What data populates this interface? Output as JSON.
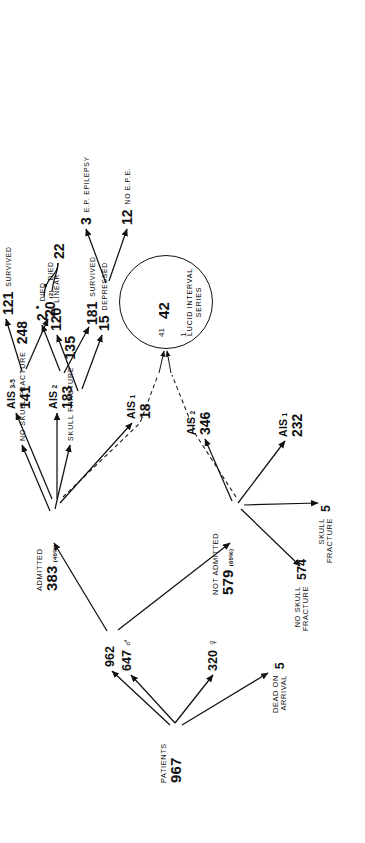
{
  "figure": {
    "type": "tree-diagram",
    "orientation": "rotated-90-ccw"
  },
  "nodes": {
    "patients": {
      "label": "PATIENTS",
      "value": "967"
    },
    "male": {
      "value": "647",
      "symbol": "♂"
    },
    "female": {
      "value": "320",
      "symbol": "♀"
    },
    "dead_on_arrival": {
      "label_line1": "DEAD ON",
      "label_line2": "ARRIVAL",
      "value": "5"
    },
    "surviving": {
      "value": "962"
    },
    "admitted": {
      "label": "ADMITTED",
      "value": "383",
      "pct": "(40%)"
    },
    "not_admitted": {
      "label": "NOT ADMITTED",
      "value": "579",
      "pct": "(60%)"
    },
    "na_no_skull_fracture": {
      "label_line1": "NO SKULL",
      "label_line2": "FRACTURE",
      "value": "574"
    },
    "na_skull_fracture": {
      "label_line1": "SKULL",
      "label_line2": "FRACTURE",
      "value": "5"
    },
    "na_ais1": {
      "label": "AIS",
      "sub": "1",
      "value": "232"
    },
    "na_ais2": {
      "label": "AIS",
      "sub": "2",
      "value": "346"
    },
    "ad_no_skull_fracture": {
      "label": "NO  SKULL  FRACTURE",
      "value": "248"
    },
    "ad_skull_fracture": {
      "label": "SKULL  FRACTURE",
      "value": "135"
    },
    "linear": {
      "value": "120",
      "label": "LINEAR"
    },
    "depressed": {
      "value": "15",
      "label": "DEPRESSED"
    },
    "ep_epilepsy": {
      "value": "3",
      "label": "E.P. EPILEPSY"
    },
    "no_ep_epilepsy": {
      "value": "12",
      "label": "NO E.P.E."
    },
    "ad_ais1": {
      "label": "AIS",
      "sub": "1",
      "value": "18"
    },
    "ad_ais2": {
      "label": "AIS",
      "sub": "2",
      "value": "183"
    },
    "ad_ais2_survived": {
      "value": "181",
      "label": "SURVIVED"
    },
    "ad_ais2_died": {
      "value": "2",
      "marker": "•",
      "label": "DIED"
    },
    "ad_ais35": {
      "label": "AIS",
      "sub": "3-5",
      "value": "141"
    },
    "ad_ais35_survived": {
      "value": "121",
      "label": "SURVIVED"
    },
    "ad_ais35_died": {
      "value": "20",
      "paren": "(2)",
      "marker": "•",
      "label": "DIED"
    },
    "total_died": {
      "value": "22"
    },
    "lucid_circle": {
      "value": "42",
      "in_from_not_admitted": "1",
      "in_from_admitted": "41",
      "caption_line1": "LUCID INTERVAL",
      "caption_line2": "SERIES"
    }
  },
  "colors": {
    "ink": "#111111",
    "paper": "#ffffff"
  }
}
